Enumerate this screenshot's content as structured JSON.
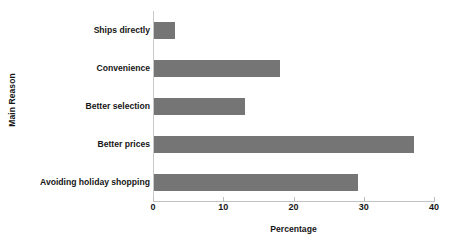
{
  "chart_data": {
    "type": "bar",
    "orientation": "horizontal",
    "title": "",
    "xlabel": "Percentage",
    "ylabel": "Main Reason",
    "categories": [
      "Ships directly",
      "Convenience",
      "Better selection",
      "Better prices",
      "Avoiding holiday shopping"
    ],
    "values": [
      3,
      18,
      13,
      37,
      29
    ],
    "xlim": [
      0,
      40
    ],
    "xticks": [
      0,
      10,
      20,
      30,
      40
    ],
    "xtick_labels": [
      "0",
      "10",
      "20",
      "30",
      "40"
    ],
    "grid": false,
    "legend": null,
    "bar_color": "#757575",
    "axis_color": "#c2c2c2",
    "text_color": "#161616",
    "background": "#ffffff"
  }
}
